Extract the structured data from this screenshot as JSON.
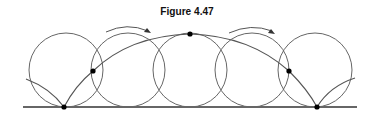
{
  "figure": {
    "title": "Figure 4.47"
  },
  "diagram": {
    "type": "cycloid-rolling-circle",
    "ground_line": {
      "x1": 23,
      "y1": 107,
      "x2": 357,
      "y2": 107
    },
    "circles": [
      {
        "cx": 66,
        "cy": 70,
        "r": 37
      },
      {
        "cx": 128,
        "cy": 70,
        "r": 37
      },
      {
        "cx": 190,
        "cy": 70,
        "r": 37
      },
      {
        "cx": 252,
        "cy": 70,
        "r": 37
      },
      {
        "cx": 315,
        "cy": 70,
        "r": 37
      }
    ],
    "points": [
      {
        "x": 64,
        "y": 107
      },
      {
        "x": 93,
        "y": 71
      },
      {
        "x": 190,
        "y": 34
      },
      {
        "x": 289,
        "y": 71
      },
      {
        "x": 317,
        "y": 107
      }
    ],
    "rotation_arrows": [
      {
        "direction": "clockwise",
        "from_x": 105,
        "to_x": 150
      },
      {
        "direction": "clockwise",
        "from_x": 228,
        "to_x": 275
      }
    ],
    "colors": {
      "line": "#555555",
      "ground": "#333333",
      "point": "#000000"
    }
  }
}
